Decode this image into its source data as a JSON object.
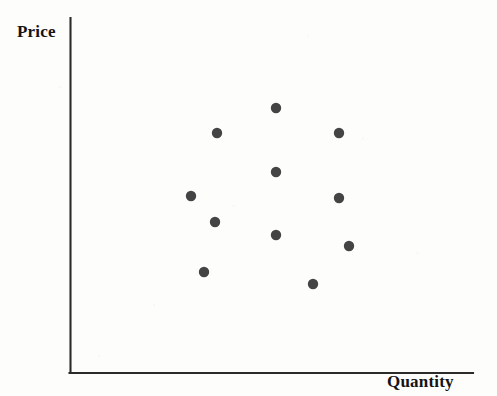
{
  "figure": {
    "kind": "scatter-plot-diagram",
    "background_color": "#fdfdfc"
  },
  "axes": {
    "y_label": "Price",
    "x_label": "Quantity",
    "axis_color": "#2b2b2b",
    "y_axis": {
      "x": 70,
      "y_top": 18,
      "y_bottom": 373
    },
    "x_axis": {
      "y": 373,
      "x_left": 70,
      "x_right": 473
    }
  },
  "chart_data": {
    "type": "scatter",
    "title": "",
    "xlabel": "Quantity",
    "ylabel": "Price",
    "grid": false,
    "legend": null,
    "xlim": [
      0,
      100
    ],
    "ylim": [
      0,
      100
    ],
    "marker": {
      "shape": "circle",
      "color": "#444444",
      "radius_px": 5.2,
      "count": 12
    },
    "axis_ticks": {
      "x": [],
      "y": []
    },
    "annotations": [],
    "points_px": [
      {
        "x": 276,
        "y": 108
      },
      {
        "x": 217,
        "y": 133
      },
      {
        "x": 339,
        "y": 133
      },
      {
        "x": 276,
        "y": 172
      },
      {
        "x": 191,
        "y": 196
      },
      {
        "x": 339,
        "y": 198
      },
      {
        "x": 215,
        "y": 222
      },
      {
        "x": 276,
        "y": 235
      },
      {
        "x": 349,
        "y": 246
      },
      {
        "x": 204,
        "y": 272
      },
      {
        "x": 313,
        "y": 284
      },
      {
        "x": 276,
        "y": 108
      }
    ],
    "points": [
      {
        "x": 51,
        "y": 75
      },
      {
        "x": 36,
        "y": 68
      },
      {
        "x": 67,
        "y": 68
      },
      {
        "x": 51,
        "y": 57
      },
      {
        "x": 30,
        "y": 50
      },
      {
        "x": 67,
        "y": 49
      },
      {
        "x": 36,
        "y": 43
      },
      {
        "x": 51,
        "y": 39
      },
      {
        "x": 69,
        "y": 36
      },
      {
        "x": 33,
        "y": 28
      },
      {
        "x": 60,
        "y": 25
      },
      {
        "x": 51,
        "y": 75
      }
    ]
  }
}
